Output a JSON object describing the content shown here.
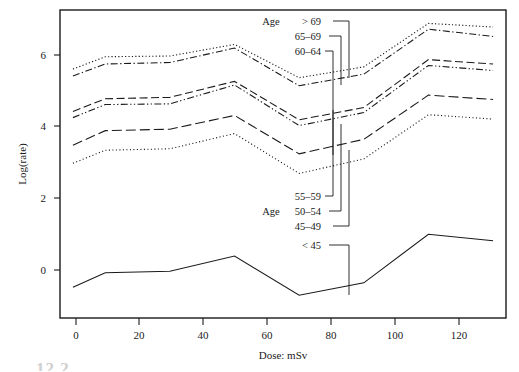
{
  "figure": {
    "caption_artifact": "12.2"
  },
  "chart_data": {
    "type": "line",
    "title": "",
    "subtitle": "",
    "xlabel": "Dose:  mSv",
    "ylabel": "Log(rate)",
    "xlim": [
      -4,
      134
    ],
    "ylim": [
      -1.35,
      7.15
    ],
    "xticks": [
      0,
      20,
      40,
      60,
      80,
      100,
      120
    ],
    "yticks": [
      0,
      2,
      4,
      6
    ],
    "grid": false,
    "legend_position": "inside-callouts",
    "legend_group_label": "Age",
    "x": [
      0,
      10,
      30,
      50,
      70,
      90,
      110,
      130
    ],
    "series": [
      {
        "name": "> 69",
        "style": "dotted",
        "values": [
          5.52,
          5.86,
          5.88,
          6.2,
          5.28,
          5.58,
          6.78,
          6.68
        ]
      },
      {
        "name": "65–69",
        "style": "dash-dot",
        "values": [
          5.33,
          5.66,
          5.7,
          6.1,
          5.06,
          5.38,
          6.62,
          6.42
        ]
      },
      {
        "name": "60–64",
        "style": "dashed",
        "values": [
          4.35,
          4.7,
          4.74,
          5.18,
          4.12,
          4.46,
          5.78,
          5.66
        ]
      },
      {
        "name": "55–59",
        "style": "dash-dot-dot",
        "values": [
          4.18,
          4.54,
          4.56,
          5.08,
          3.96,
          4.32,
          5.62,
          5.48
        ]
      },
      {
        "name": "50–54",
        "style": "long-dash",
        "values": [
          3.42,
          3.82,
          3.86,
          4.24,
          3.18,
          3.58,
          4.8,
          4.68
        ]
      },
      {
        "name": "45–49",
        "style": "fine-dotted",
        "values": [
          2.92,
          3.28,
          3.32,
          3.74,
          2.64,
          3.04,
          4.26,
          4.14
        ]
      },
      {
        "name": "< 45",
        "style": "solid",
        "values": [
          -0.5,
          -0.1,
          -0.06,
          0.36,
          -0.72,
          -0.38,
          0.96,
          0.78
        ]
      }
    ],
    "callouts_top": [
      "> 69",
      "65–69",
      "60–64"
    ],
    "callouts_bottom": [
      "55–59",
      "50–54",
      "45–49",
      "< 45"
    ]
  }
}
